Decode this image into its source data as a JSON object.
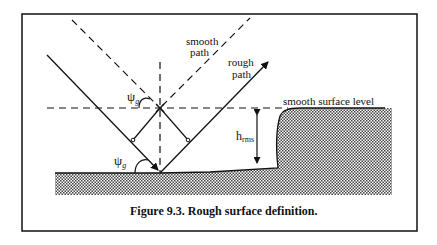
{
  "figure": {
    "caption": "Figure 9.3. Rough surface definition.",
    "labels": {
      "smooth_path_line1": "smooth",
      "smooth_path_line2": "path",
      "rough_path_line1": "rough",
      "rough_path_line2": "path",
      "smooth_surface_level": "smooth surface level",
      "h_rms_main": "h",
      "h_rms_sub": "rms",
      "psi_upper_main": "ψ",
      "psi_upper_sub": "g",
      "psi_lower_main": "ψ",
      "psi_lower_sub": "g"
    },
    "colors": {
      "line": "#111111",
      "background": "#ffffff",
      "hatch": "#555555"
    }
  }
}
